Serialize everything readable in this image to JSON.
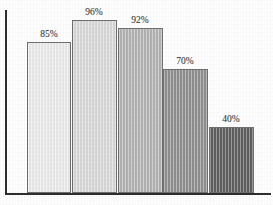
{
  "chart_data": {
    "type": "bar",
    "title": "",
    "subtitle": "",
    "xlabel": "",
    "ylabel": "",
    "categories": [
      "",
      "",
      "",
      "",
      ""
    ],
    "values": [
      85,
      96,
      92,
      70,
      40
    ],
    "value_labels": [
      "85%",
      "96%",
      "92%",
      "70%",
      "40%"
    ],
    "ylim": [
      0,
      100
    ],
    "grid": false,
    "legend": false,
    "legend_position": "none",
    "axis_color": "#2e2e2e",
    "bar_border_color": "#6f6f6f",
    "bar_colors": [
      "#ebebeb",
      "#d8d8d8",
      "#b4b4b4",
      "#8f8f8f",
      "#5e5e5e"
    ],
    "bars": [
      {
        "label": "85%",
        "value": 85,
        "color": "#ebebeb",
        "x": 27,
        "width": 44,
        "top": 42,
        "label_x": 49,
        "label_y": 29
      },
      {
        "label": "96%",
        "value": 96,
        "color": "#d8d8d8",
        "x": 72,
        "width": 45,
        "top": 20,
        "label_x": 94,
        "label_y": 7
      },
      {
        "label": "92%",
        "value": 92,
        "color": "#b4b4b4",
        "x": 118,
        "width": 45,
        "top": 28,
        "label_x": 140,
        "label_y": 15
      },
      {
        "label": "70%",
        "value": 70,
        "color": "#8f8f8f",
        "x": 163,
        "width": 45,
        "top": 69,
        "label_x": 185,
        "label_y": 56
      },
      {
        "label": "40%",
        "value": 40,
        "color": "#5e5e5e",
        "x": 209,
        "width": 45,
        "top": 127,
        "label_x": 231,
        "label_y": 114
      }
    ],
    "axes": {
      "y_axis": {
        "x": 5,
        "top": 10,
        "height": 185,
        "thickness": 2
      },
      "x_axis": {
        "x": 5,
        "y": 193,
        "width": 266,
        "thickness": 2
      },
      "baseline_y": 193
    }
  }
}
